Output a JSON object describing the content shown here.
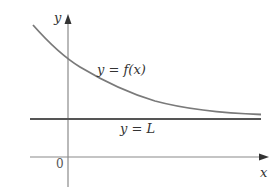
{
  "diagram": {
    "type": "function-limit-graph",
    "axes": {
      "x_label": "x",
      "y_label": "y",
      "origin_label": "0"
    },
    "curve": {
      "label": "y = f(x)",
      "color": "#7a7a7a"
    },
    "asymptote": {
      "label": "y = L",
      "color": "#555555"
    },
    "axis_color": "#8a8a8a",
    "text_color": "#333333"
  }
}
